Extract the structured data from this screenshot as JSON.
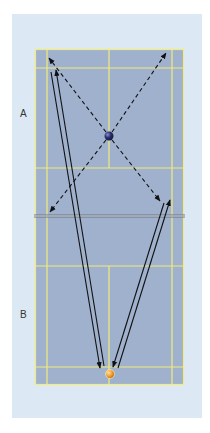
{
  "diagram": {
    "type": "badminton-court-drill",
    "labels": {
      "side_a": "A",
      "side_b": "B"
    },
    "colors": {
      "panel_bg": "#dce9f4",
      "court_fill": "#9fb1cc",
      "court_lines": "#f2ec7a",
      "net": "#6e747c",
      "arrows": "#111111",
      "player_a_ball": "#2a2f6e",
      "player_b_ball": "#f0a030"
    },
    "players": [
      {
        "id": "A",
        "marker": "blue-ball",
        "x": 109,
        "y": 136
      },
      {
        "id": "B",
        "marker": "orange-ball",
        "x": 110,
        "y": 374
      }
    ],
    "movement_arrows_dashed": [
      {
        "from": [
          109,
          136
        ],
        "to": [
          49,
          58
        ],
        "desc": "A to rear left"
      },
      {
        "from": [
          109,
          136
        ],
        "to": [
          166,
          53
        ],
        "desc": "A to rear right"
      },
      {
        "from": [
          109,
          136
        ],
        "to": [
          50,
          212
        ],
        "desc": "A to front left"
      },
      {
        "from": [
          109,
          136
        ],
        "to": [
          160,
          201
        ],
        "desc": "A to front right"
      }
    ],
    "shot_arrows_solid": [
      {
        "from": [
          104,
          366
        ],
        "to": [
          56,
          69
        ],
        "desc": "B clear to rear left"
      },
      {
        "from": [
          50,
          72
        ],
        "to": [
          100,
          369
        ],
        "desc": "return to B"
      },
      {
        "from": [
          118,
          368
        ],
        "to": [
          170,
          199
        ],
        "desc": "B to front right"
      },
      {
        "from": [
          164,
          202
        ],
        "to": [
          113,
          368
        ],
        "desc": "return to B"
      }
    ]
  }
}
